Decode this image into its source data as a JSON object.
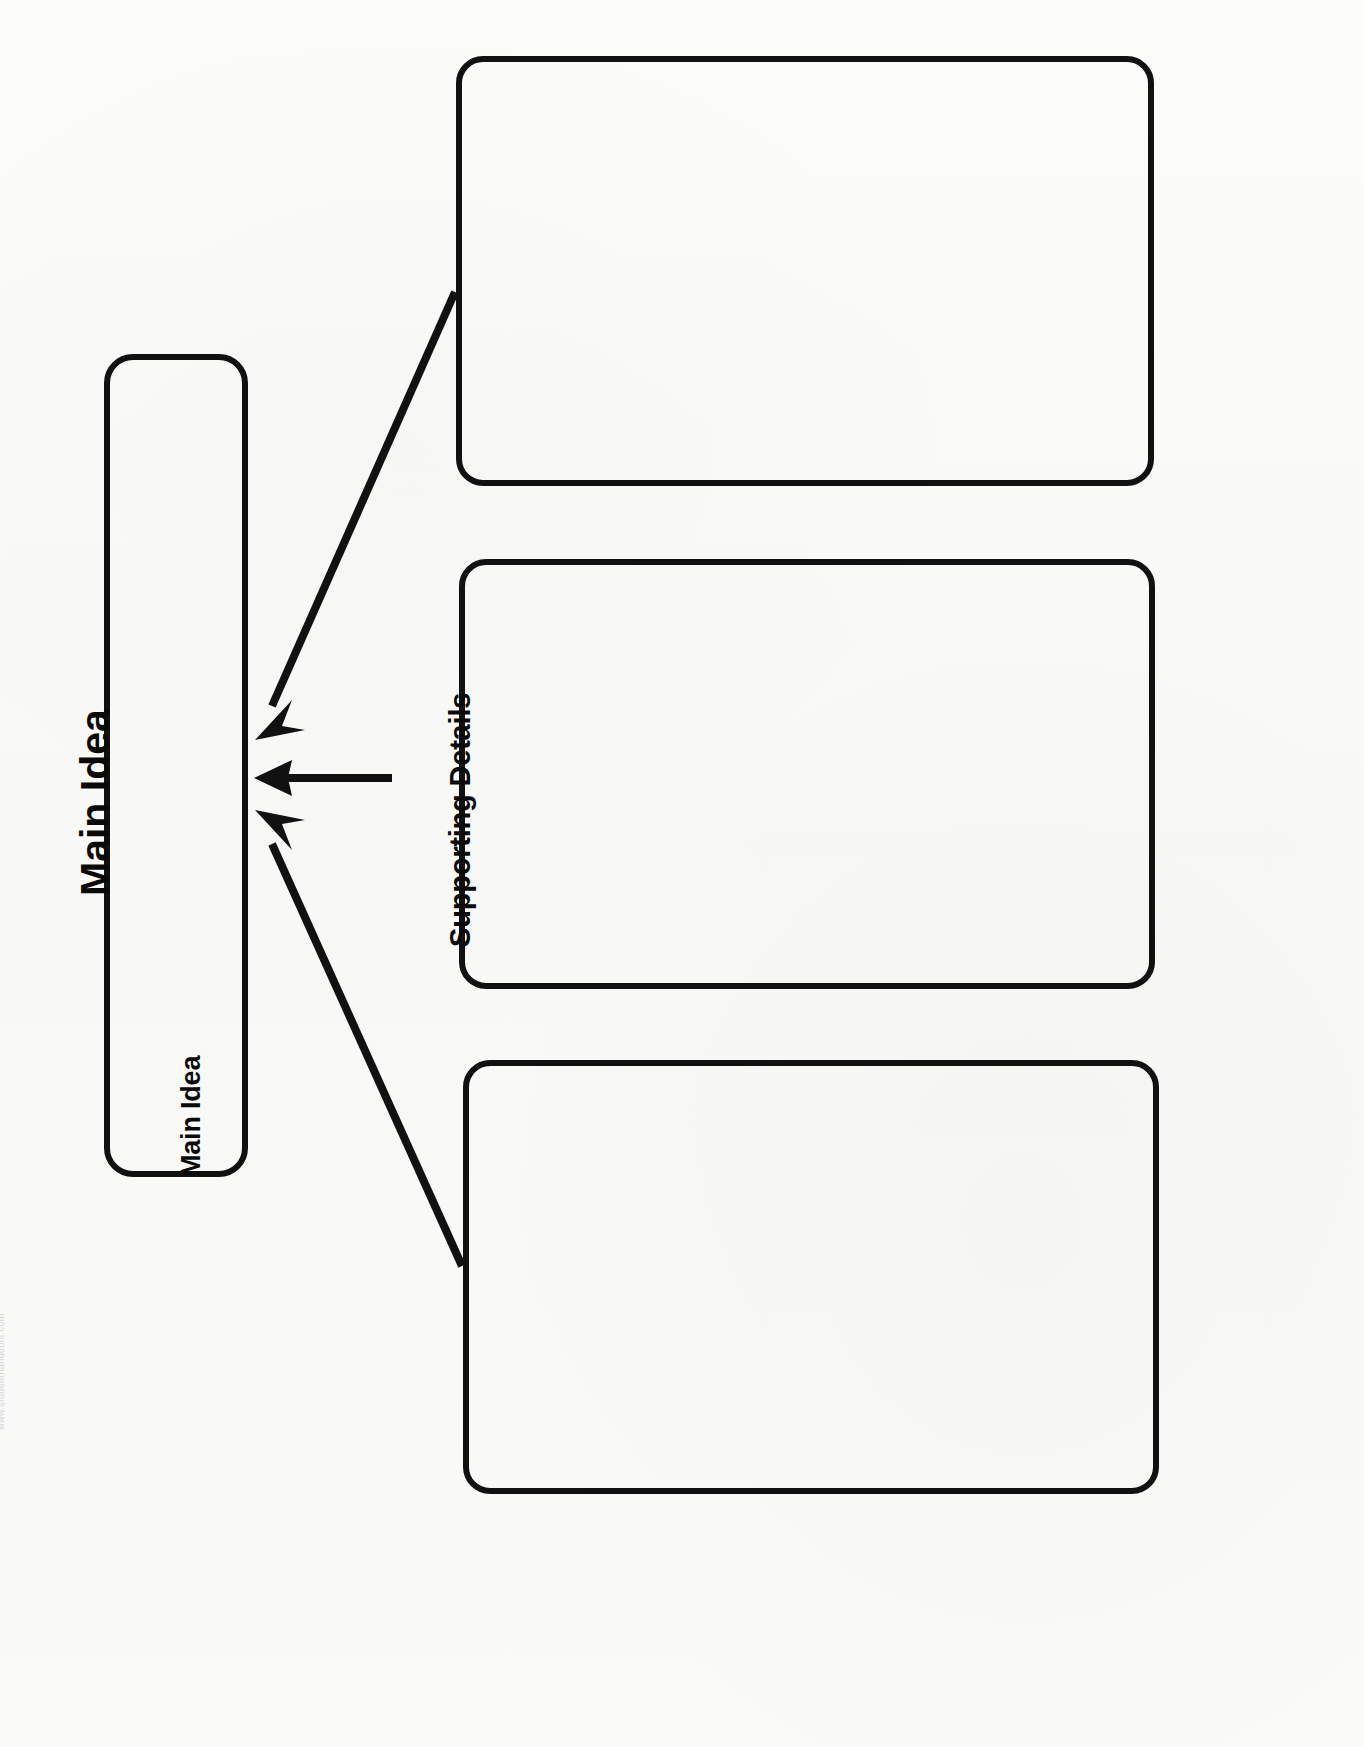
{
  "document": {
    "title": "Main Idea",
    "orientation": "rotated-90-ccw",
    "page_background": "#fbfbfa",
    "ink_color": "#111111"
  },
  "header": {
    "title": "Main Idea"
  },
  "organizer": {
    "type": "main-idea-and-supporting-details",
    "main_idea_box": {
      "label": "Main Idea",
      "value": "",
      "placeholder": ""
    },
    "connector_label": "Supporting Details",
    "detail_boxes": [
      {
        "label": "Supporting Detail 1",
        "value": "",
        "placeholder": ""
      },
      {
        "label": "Supporting Detail 2",
        "value": "",
        "placeholder": ""
      },
      {
        "label": "Supporting Detail 3",
        "value": "",
        "placeholder": ""
      }
    ],
    "arrow_count": 3
  },
  "watermark": {
    "text": "www.studenthandouts.com"
  }
}
